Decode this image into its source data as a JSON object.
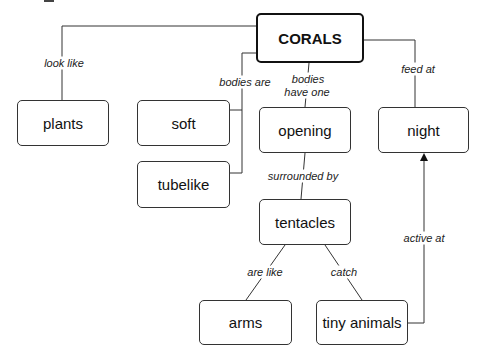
{
  "diagram": {
    "type": "concept-map",
    "root": {
      "id": "corals",
      "label": "CORALS"
    },
    "nodes": [
      {
        "id": "corals",
        "label": "CORALS"
      },
      {
        "id": "plants",
        "label": "plants"
      },
      {
        "id": "soft",
        "label": "soft"
      },
      {
        "id": "tubelike",
        "label": "tubelike"
      },
      {
        "id": "opening",
        "label": "opening"
      },
      {
        "id": "night",
        "label": "night"
      },
      {
        "id": "tentacles",
        "label": "tentacles"
      },
      {
        "id": "arms",
        "label": "arms"
      },
      {
        "id": "tiny_animals",
        "label": "tiny animals"
      }
    ],
    "edges": [
      {
        "from": "corals",
        "to": "plants",
        "label": "look like"
      },
      {
        "from": "corals",
        "to": "soft",
        "label": "bodies are"
      },
      {
        "from": "corals",
        "to": "tubelike",
        "label": "bodies are"
      },
      {
        "from": "corals",
        "to": "opening",
        "label": "bodies have one"
      },
      {
        "from": "corals",
        "to": "night",
        "label": "feed at"
      },
      {
        "from": "opening",
        "to": "tentacles",
        "label": "surrounded by"
      },
      {
        "from": "tentacles",
        "to": "arms",
        "label": "are like"
      },
      {
        "from": "tentacles",
        "to": "tiny_animals",
        "label": "catch"
      },
      {
        "from": "tiny_animals",
        "to": "night",
        "label": "active at",
        "arrow": true
      }
    ],
    "edge_labels": {
      "look_like": "look like",
      "bodies_are": "bodies are",
      "bodies_have_one_1": "bodies",
      "bodies_have_one_2": "have one",
      "feed_at": "feed at",
      "surrounded_by": "surrounded by",
      "are_like": "are like",
      "catch": "catch",
      "active_at": "active at"
    },
    "colors": {
      "line": "#333333",
      "text": "#111111",
      "background": "#ffffff"
    }
  }
}
